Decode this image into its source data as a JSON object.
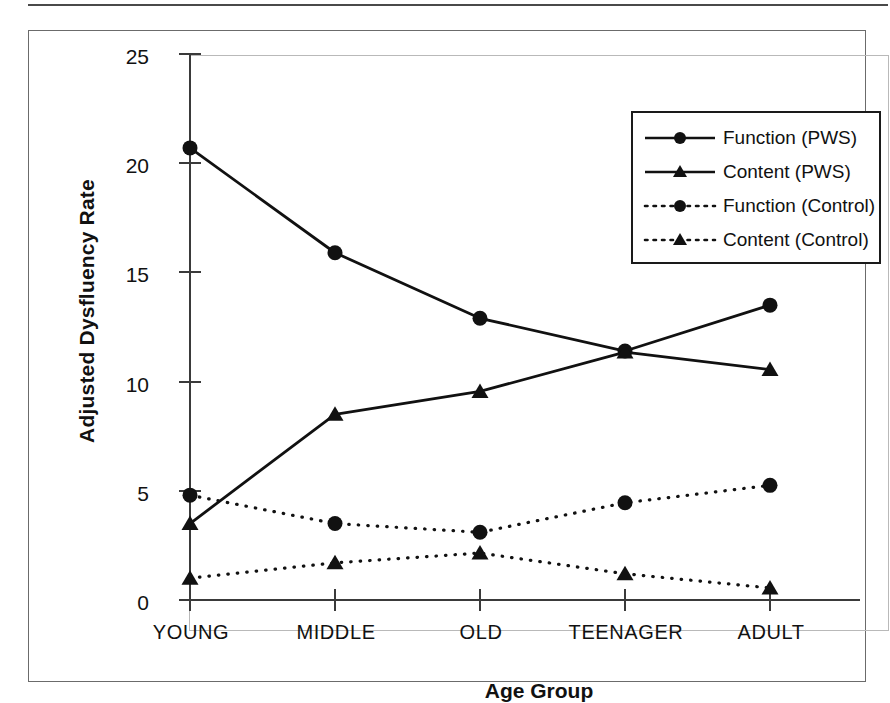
{
  "figure": {
    "frame_color": "#6b6b6b",
    "plot_border_color": "#b9b9b9",
    "series_color": "#111111"
  },
  "chart_data": {
    "type": "line",
    "title": "",
    "xlabel": "Age Group",
    "ylabel": "Adjusted Dysfluency Rate",
    "categories": [
      "YOUNG",
      "MIDDLE",
      "OLD",
      "TEENAGER",
      "ADULT"
    ],
    "ylim": [
      0,
      25
    ],
    "yticks": [
      0,
      5,
      10,
      15,
      20,
      25
    ],
    "ytick_labels": [
      "0",
      "5",
      "10",
      "15",
      "20",
      "25"
    ],
    "grid": false,
    "legend_position": "top-right",
    "series": [
      {
        "name": "Function (PWS)",
        "marker": "circle",
        "linestyle": "solid",
        "color": "#111111",
        "values": [
          20.7,
          15.9,
          12.9,
          11.4,
          13.5
        ]
      },
      {
        "name": "Content (PWS)",
        "marker": "triangle",
        "linestyle": "solid",
        "color": "#111111",
        "values": [
          3.5,
          8.5,
          9.55,
          11.35,
          10.55
        ]
      },
      {
        "name": "Function (Control)",
        "marker": "circle",
        "linestyle": "dotted",
        "color": "#111111",
        "values": [
          4.8,
          3.5,
          3.1,
          4.45,
          5.25
        ]
      },
      {
        "name": "Content (Control)",
        "marker": "triangle",
        "linestyle": "dotted",
        "color": "#111111",
        "values": [
          1.0,
          1.7,
          2.15,
          1.2,
          0.55
        ]
      }
    ]
  },
  "legend": {
    "items": [
      {
        "label": "Function (PWS)",
        "marker": "circle",
        "linestyle": "solid"
      },
      {
        "label": "Content (PWS)",
        "marker": "triangle",
        "linestyle": "solid"
      },
      {
        "label": "Function (Control)",
        "marker": "circle",
        "linestyle": "dotted"
      },
      {
        "label": "Content (Control)",
        "marker": "triangle",
        "linestyle": "dotted"
      }
    ]
  }
}
